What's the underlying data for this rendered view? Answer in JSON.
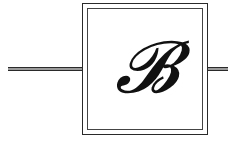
{
  "diagram": {
    "block": {
      "label": "𝓑"
    },
    "connections": [
      {
        "name": "input",
        "side": "left"
      },
      {
        "name": "output",
        "side": "right"
      }
    ],
    "colors": {
      "stroke": "#2a2a2a",
      "background": "#ffffff"
    }
  }
}
